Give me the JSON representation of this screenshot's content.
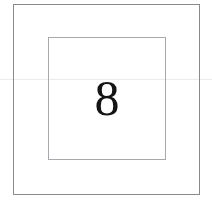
{
  "figure": {
    "background_color": "#ffffff",
    "outer_square": {
      "name": "outer square border",
      "stroke_color": "#8a8a8e",
      "stroke_width": "1px",
      "fill": "none"
    },
    "inner_square": {
      "name": "inner square border",
      "stroke_color": "#a9a9ad",
      "stroke_width": "1px",
      "fill": "none"
    },
    "numeral": {
      "value": "8",
      "color": "#141414",
      "style": "serif"
    },
    "scan_line": {
      "name": "faint horizontal scan artifact",
      "color": "#ececed"
    }
  }
}
